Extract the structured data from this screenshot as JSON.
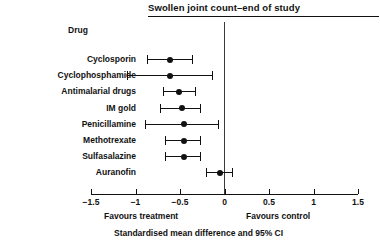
{
  "chart_data": {
    "type": "forest",
    "title": "Swollen joint count–end of study",
    "row_header": "Drug",
    "xlabel": "Standardised mean difference and 95% CI",
    "ylabel": "",
    "xlim": [
      -1.5,
      1.5
    ],
    "xticks": [
      -1.5,
      -1,
      -0.5,
      0,
      0.5,
      1,
      1.5
    ],
    "xtick_labels": [
      "−1.5",
      "−1",
      "−0.5",
      "0",
      "0.5",
      "1",
      "1.5"
    ],
    "grid": false,
    "reference_line": 0,
    "left_annotation": "Favours treatment",
    "right_annotation": "Favours control",
    "categories": [
      "Cyclosporin",
      "Cyclophosphamide",
      "Antimalarial drugs",
      "IM gold",
      "Penicillamine",
      "Methotrexate",
      "Sulfasalazine",
      "Auranofin"
    ],
    "points": [
      {
        "label": "Cyclosporin",
        "estimate": -0.61,
        "ci_low": -0.87,
        "ci_high": -0.36
      },
      {
        "label": "Cyclophosphamide",
        "estimate": -0.61,
        "ci_low": -1.1,
        "ci_high": -0.14
      },
      {
        "label": "Antimalarial drugs",
        "estimate": -0.51,
        "ci_low": -0.69,
        "ci_high": -0.33
      },
      {
        "label": "IM gold",
        "estimate": -0.48,
        "ci_low": -0.72,
        "ci_high": -0.27
      },
      {
        "label": "Penicillamine",
        "estimate": -0.45,
        "ci_low": -0.89,
        "ci_high": -0.07
      },
      {
        "label": "Methotrexate",
        "estimate": -0.45,
        "ci_low": -0.67,
        "ci_high": -0.27
      },
      {
        "label": "Sulfasalazine",
        "estimate": -0.45,
        "ci_low": -0.67,
        "ci_high": -0.27
      },
      {
        "label": "Auranofin",
        "estimate": -0.05,
        "ci_low": -0.21,
        "ci_high": 0.08
      }
    ],
    "colors": {
      "marker": "#111111",
      "line": "#111111",
      "reference_line": "#3a3a3a",
      "axis": "#111111",
      "background": "#ffffff"
    }
  }
}
